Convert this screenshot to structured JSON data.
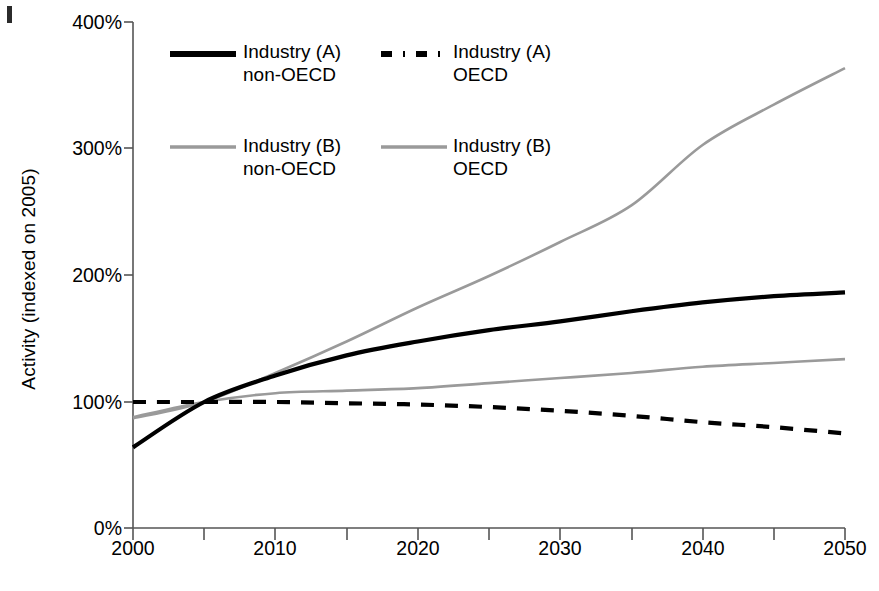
{
  "chart_data": {
    "type": "line",
    "title": "",
    "xlabel": "",
    "ylabel": "Activity (indexed on 2005)",
    "xlim": [
      2000,
      2050
    ],
    "ylim": [
      0,
      400
    ],
    "x_ticks": [
      "2000",
      "2010",
      "2020",
      "2030",
      "2040",
      "2050"
    ],
    "x_tick_values": [
      2000,
      2010,
      2020,
      2030,
      2040,
      2050
    ],
    "x_minor_tick_values": [
      2005,
      2015,
      2025,
      2035,
      2045
    ],
    "y_ticks": [
      "0%",
      "100%",
      "200%",
      "300%",
      "400%"
    ],
    "y_tick_values": [
      0,
      100,
      200,
      300,
      400
    ],
    "grid": false,
    "legend_position": "inside-top-left",
    "x": [
      2000,
      2005,
      2010,
      2015,
      2020,
      2025,
      2030,
      2035,
      2040,
      2045,
      2050
    ],
    "series": [
      {
        "name": "Industry (A) non-OECD",
        "style": "solid",
        "color": "#000000",
        "width": 4.2,
        "values": [
          64,
          100,
          121,
          137,
          148,
          157,
          164,
          172,
          179,
          184,
          187
        ]
      },
      {
        "name": "Industry (A) OECD",
        "style": "dashed",
        "color": "#000000",
        "width": 4.2,
        "values": [
          100,
          100,
          100,
          99,
          98,
          96,
          93,
          89,
          84,
          80,
          75
        ]
      },
      {
        "name": "Industry (B) non-OECD",
        "style": "solid",
        "color": "#9a9a9a",
        "width": 2.6,
        "values": [
          87,
          100,
          123,
          148,
          175,
          200,
          227,
          256,
          304,
          336,
          365
        ]
      },
      {
        "name": "Industry (B) OECD",
        "style": "solid",
        "color": "#9a9a9a",
        "width": 2.6,
        "values": [
          88,
          100,
          107,
          109,
          111,
          115,
          119,
          123,
          128,
          131,
          134
        ]
      }
    ]
  },
  "legend": {
    "entries": [
      {
        "label_line1": "Industry (A)",
        "label_line2": "non-OECD",
        "style": "solid",
        "color": "#000000"
      },
      {
        "label_line1": "Industry (A)",
        "label_line2": "OECD",
        "style": "dash-dot",
        "color": "#000000"
      },
      {
        "label_line1": "Industry (B)",
        "label_line2": "non-OECD",
        "style": "solid",
        "color": "#9a9a9a"
      },
      {
        "label_line1": "Industry (B)",
        "label_line2": "OECD",
        "style": "solid",
        "color": "#9a9a9a"
      }
    ]
  },
  "axes": {
    "y_title": "Activity (indexed on 2005)",
    "y_tick_0": "0%",
    "y_tick_1": "100%",
    "y_tick_2": "200%",
    "y_tick_3": "300%",
    "y_tick_4": "400%",
    "x_tick_0": "2000",
    "x_tick_1": "2010",
    "x_tick_2": "2020",
    "x_tick_3": "2030",
    "x_tick_4": "2040",
    "x_tick_5": "2050"
  },
  "colors": {
    "axis": "#555555",
    "series_dark": "#000000",
    "series_gray": "#9a9a9a",
    "background": "#ffffff"
  }
}
